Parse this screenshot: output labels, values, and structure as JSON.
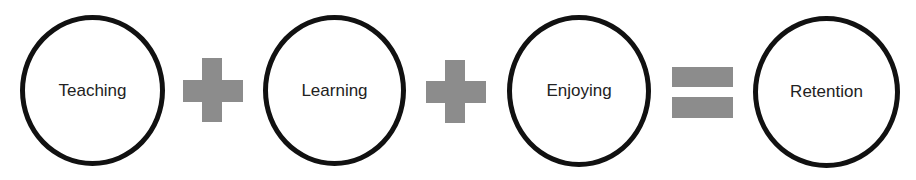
{
  "diagram": {
    "nodes": [
      {
        "label": "Teaching"
      },
      {
        "label": "Learning"
      },
      {
        "label": "Enjoying"
      },
      {
        "label": "Retention"
      }
    ],
    "operators": [
      "plus-icon",
      "plus-icon",
      "equals-icon"
    ],
    "colors": {
      "circle_border": "#111111",
      "operator": "#8c8c8c",
      "background": "#ffffff"
    }
  }
}
